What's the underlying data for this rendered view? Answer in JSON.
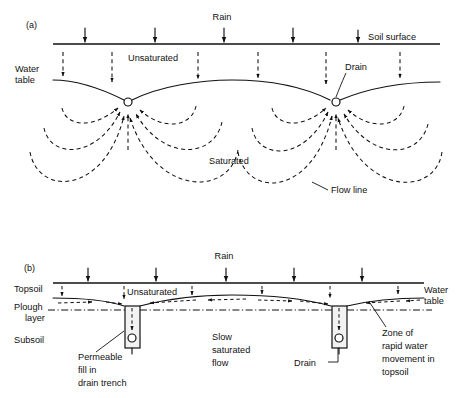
{
  "figure": {
    "background_color": "#ffffff",
    "ink_color": "#111111"
  },
  "panel_a": {
    "panel_label": "(a)",
    "labels": {
      "rain": "Rain",
      "soil_surface": "Soil surface",
      "water_table_line1": "Water",
      "water_table_line2": "table",
      "unsaturated": "Unsaturated",
      "drain": "Drain",
      "saturated": "Saturated",
      "flow_line": "Flow line"
    },
    "rain_arrows_x": [
      85,
      155,
      224,
      293,
      358
    ],
    "rain_arrow_tip_y": 44,
    "surface_y": 44,
    "surface_x_start": 53,
    "surface_x_end": 440,
    "infiltration_arrows_x": [
      63,
      112,
      198,
      258,
      326,
      400
    ],
    "drain_nodes": [
      {
        "x": 128,
        "y": 102
      },
      {
        "x": 336,
        "y": 102
      }
    ],
    "water_table_min_y": 80,
    "flow_line_count_per_drain": 3
  },
  "panel_b": {
    "panel_label": "(b)",
    "labels": {
      "rain": "Rain",
      "topsoil": "Topsoil",
      "plough_line1": "Plough",
      "plough_line2": "layer",
      "subsoil": "Subsoil",
      "unsaturated": "Unsaturated",
      "water_table_line1": "Water",
      "water_table_line2": "table",
      "slow_flow_line1": "Slow",
      "slow_flow_line2": "saturated",
      "slow_flow_line3": "flow",
      "drain": "Drain",
      "permeable_line1": "Permeable",
      "permeable_line2": "fill in",
      "permeable_line3": "drain trench",
      "zone_line1": "Zone of",
      "zone_line2": "rapid water",
      "zone_line3": "movement in",
      "zone_line4": "topsoil"
    },
    "rain_arrows_x": [
      88,
      156,
      226,
      294,
      362
    ],
    "surface_y": 283,
    "surface_x_start": 53,
    "surface_x_end": 424,
    "infiltration_arrows_x": [
      62,
      124,
      192,
      262,
      330,
      398
    ],
    "plough_layer_y": 307,
    "trenches": [
      {
        "x": 125,
        "y": 306,
        "width": 15,
        "height": 42,
        "pipe_cx": 132,
        "pipe_cy": 338,
        "pipe_r": 4
      },
      {
        "x": 332,
        "y": 306,
        "width": 15,
        "height": 42,
        "pipe_cx": 339,
        "pipe_cy": 338,
        "pipe_r": 4
      }
    ],
    "lateral_flow_arrow_count": 8
  }
}
